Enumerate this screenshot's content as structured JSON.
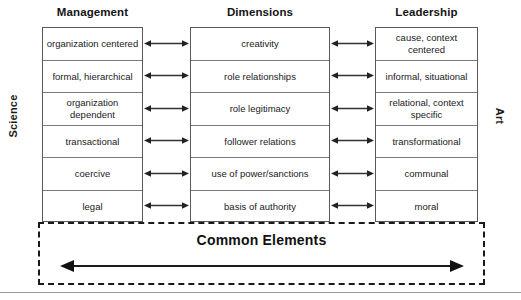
{
  "diagram": {
    "axis_labels": {
      "left": "Science",
      "right": "Art"
    },
    "columns": [
      {
        "id": "management",
        "header": "Management",
        "cells": [
          "organization centered",
          "formal, hierarchical",
          "organization dependent",
          "transactional",
          "coercive",
          "legal"
        ]
      },
      {
        "id": "dimensions",
        "header": "Dimensions",
        "cells": [
          "creativity",
          "role relationships",
          "role legitimacy",
          "follower relations",
          "use of power/sanctions",
          "basis of authority"
        ]
      },
      {
        "id": "leadership",
        "header": "Leadership",
        "cells": [
          "cause, context centered",
          "informal, situational",
          "relational, context specific",
          "transformational",
          "communal",
          "moral"
        ]
      }
    ],
    "connectors": {
      "icon": "double-headed-arrow-icon",
      "count_per_side": 6
    },
    "common_panel": {
      "label": "Common Elements",
      "arrow_icon": "double-headed-arrow-icon"
    },
    "colors": {
      "stroke": "#595959",
      "row_divider": "#7a7a7a",
      "text": "#1a1a1a",
      "dashed_border": "#1a1a1a",
      "hairline": "#9a9a9a",
      "background": "#ffffff"
    }
  }
}
